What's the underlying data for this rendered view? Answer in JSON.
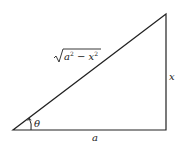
{
  "diagram": {
    "type": "right-triangle",
    "labels": {
      "hypotenuse_base": "a",
      "hypotenuse_sup1": "2",
      "hypotenuse_minus": " − ",
      "hypotenuse_var": "x",
      "hypotenuse_sup2": "2",
      "vertical_side": "x",
      "horizontal_side": "a",
      "angle": "θ"
    },
    "colors": {
      "stroke": "#222222",
      "background": "#ffffff"
    }
  }
}
